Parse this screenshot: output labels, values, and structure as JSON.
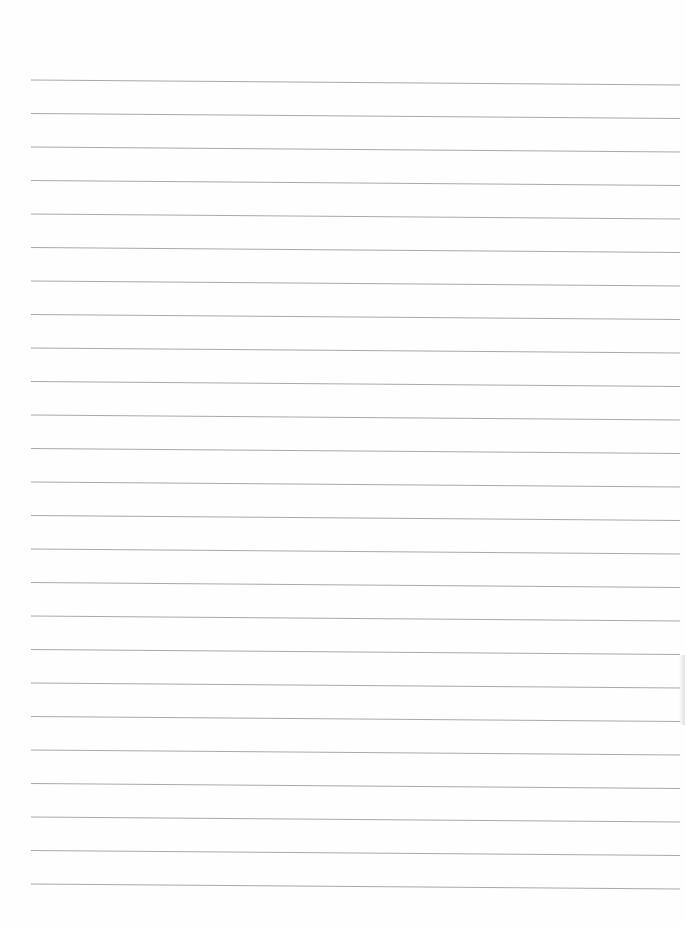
{
  "document": {
    "type": "lined-paper",
    "line_count": 25,
    "line_color": "#9a9a9a",
    "paper_color": "#fefefe",
    "content": []
  }
}
